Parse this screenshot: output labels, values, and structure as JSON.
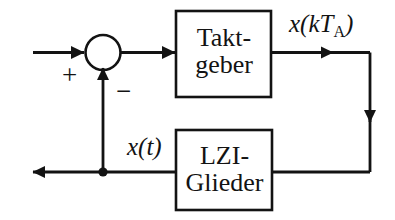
{
  "diagram": {
    "type": "block-diagram",
    "language": "de",
    "colors": {
      "stroke": "#131313",
      "background": "#ffffff",
      "text": "#131313"
    },
    "blocks": [
      {
        "id": "takt-geber",
        "line1": "Takt-",
        "line2": "geber",
        "text": "Takt-geber"
      },
      {
        "id": "lzi-glieder",
        "line1": "LZI-",
        "line2": "Glieder",
        "text": "LZI-Glieder"
      }
    ],
    "labels": {
      "sampled_signal": "x(kT",
      "sampled_signal_sub": "A",
      "sampled_signal_close": ")",
      "continuous_signal": "x(t)",
      "sum_plus": "+",
      "sum_minus": "−"
    },
    "nodes": {
      "summing_junction": "sum-circle",
      "branch_point": "branch-dot"
    },
    "signals": [
      "input-arrow",
      "sum-to-takt-arrow",
      "takt-output-arrow",
      "feedback-down-arrow",
      "feedback-bottom-line",
      "lzi-to-branch-line",
      "output-left-arrow",
      "feedback-up-arrow"
    ]
  }
}
